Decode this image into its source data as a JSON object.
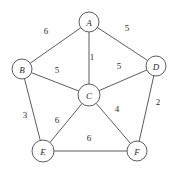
{
  "figure": {
    "background_color": "#ffffff",
    "line_color": "#5d5d5d",
    "text_color": "#2e2e2e"
  },
  "chart_data": {
    "type": "diagram",
    "subtype": "weighted-undirected-graph",
    "title": "",
    "xlabel": "",
    "ylabel": "",
    "grid": false,
    "legend": null,
    "nodes": [
      {
        "id": "A",
        "label": "A",
        "x": 89,
        "y": 22,
        "r": 10
      },
      {
        "id": "B",
        "label": "B",
        "x": 22,
        "y": 69,
        "r": 10
      },
      {
        "id": "C",
        "label": "C",
        "x": 89,
        "y": 95,
        "r": 11
      },
      {
        "id": "D",
        "label": "D",
        "x": 156,
        "y": 66,
        "r": 10
      },
      {
        "id": "E",
        "label": "E",
        "x": 43,
        "y": 151,
        "r": 11
      },
      {
        "id": "F",
        "label": "F",
        "x": 137,
        "y": 151,
        "r": 10
      }
    ],
    "edges": [
      {
        "source": "A",
        "target": "B",
        "weight": 6,
        "label": "6",
        "label_x": 46,
        "label_y": 31
      },
      {
        "source": "A",
        "target": "D",
        "weight": 5,
        "label": "5",
        "label_x": 127,
        "label_y": 28
      },
      {
        "source": "A",
        "target": "C",
        "weight": 1,
        "label": "1",
        "label_x": 92,
        "label_y": 57
      },
      {
        "source": "B",
        "target": "C",
        "weight": 5,
        "label": "5",
        "label_x": 57,
        "label_y": 70
      },
      {
        "source": "C",
        "target": "D",
        "weight": 5,
        "label": "5",
        "label_x": 119,
        "label_y": 66
      },
      {
        "source": "B",
        "target": "E",
        "weight": 3,
        "label": "3",
        "label_x": 25,
        "label_y": 115
      },
      {
        "source": "C",
        "target": "E",
        "weight": 6,
        "label": "6",
        "label_x": 57,
        "label_y": 120
      },
      {
        "source": "C",
        "target": "F",
        "weight": 4,
        "label": "4",
        "label_x": 117,
        "label_y": 109
      },
      {
        "source": "D",
        "target": "F",
        "weight": 2,
        "label": "2",
        "label_x": 158,
        "label_y": 102
      },
      {
        "source": "E",
        "target": "F",
        "weight": 6,
        "label": "6",
        "label_x": 89,
        "label_y": 138
      }
    ]
  }
}
